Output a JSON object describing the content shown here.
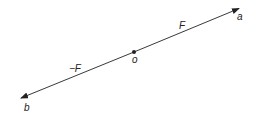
{
  "diagram": {
    "type": "force-vector-diagram",
    "colors": {
      "line": "#222222",
      "background": "#ffffff"
    },
    "points": {
      "a": {
        "label": "a",
        "x": 239,
        "y": 8
      },
      "b": {
        "label": "b",
        "x": 21,
        "y": 98
      },
      "o": {
        "label": "o",
        "x": 134,
        "y": 52
      }
    },
    "vectors": [
      {
        "name": "F",
        "label": "F",
        "from": "o",
        "to": "a"
      },
      {
        "name": "neg-F",
        "label": "−F",
        "from": "o",
        "to": "b"
      }
    ]
  }
}
